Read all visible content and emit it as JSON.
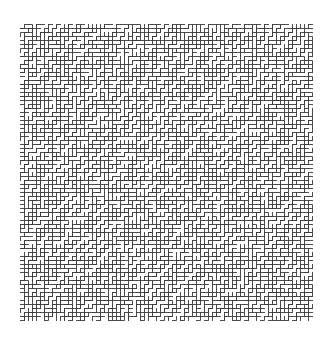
{
  "image": {
    "description": "Square maze-like meander pattern of thin dark orthogonal line segments forming diagonal staircase zigzags on white background",
    "background": "#ffffff",
    "line_color": "#3a3a3a",
    "pattern_box": {
      "x": 20,
      "y": 24,
      "width": 293,
      "height": 298
    },
    "cell_size": 4,
    "dominant_direction": "bottom-left to top-right diagonal"
  }
}
